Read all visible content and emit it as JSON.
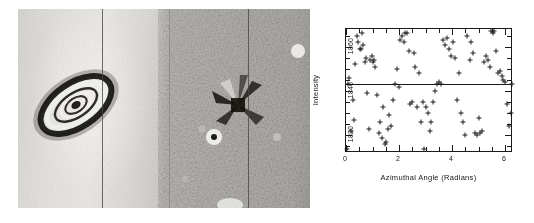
{
  "figure": {
    "panels": [
      {
        "name": "galaxy-image",
        "caption": ""
      },
      {
        "name": "residual-image",
        "caption": ""
      }
    ]
  },
  "chart_data": {
    "type": "scatter",
    "title": "",
    "xlabel": "Azimuthal Angle (Radians)",
    "ylabel": "Intensity",
    "xlim": [
      0,
      6.3
    ],
    "ylim": [
      1812,
      1868
    ],
    "xticks": [
      0,
      2,
      4,
      6
    ],
    "xticklabels": [
      "0",
      "2",
      "4",
      "6"
    ],
    "yticks": [
      1820,
      1840,
      1860
    ],
    "yticklabels": [
      "1820",
      "1840",
      "1860"
    ],
    "grid": false,
    "legend": null,
    "marker": "plus",
    "marker_color": "#1c1c1c",
    "fit_line": {
      "type": "horizontal",
      "y": 1843.0,
      "color": "#1a1a1a"
    },
    "x": [
      0.05,
      0.08,
      0.13,
      0.2,
      0.26,
      0.3,
      0.34,
      0.41,
      0.46,
      0.52,
      0.57,
      0.62,
      0.66,
      0.7,
      0.75,
      0.8,
      0.86,
      0.92,
      0.97,
      1.02,
      1.06,
      1.11,
      1.17,
      1.23,
      1.29,
      1.35,
      1.41,
      1.47,
      1.52,
      1.58,
      1.64,
      1.71,
      1.78,
      1.85,
      1.92,
      1.99,
      2.05,
      2.11,
      2.18,
      2.24,
      2.3,
      2.36,
      2.42,
      2.48,
      2.55,
      2.62,
      2.69,
      2.76,
      2.83,
      2.9,
      2.96,
      3.02,
      3.08,
      3.15,
      3.22,
      3.29,
      3.36,
      3.43,
      3.5,
      3.58,
      3.66,
      3.74,
      3.82,
      3.9,
      3.97,
      4.04,
      4.11,
      4.18,
      4.26,
      4.34,
      4.42,
      4.5,
      4.58,
      4.66,
      4.73,
      4.8,
      4.87,
      4.94,
      5.0,
      5.07,
      5.14,
      5.21,
      5.28,
      5.35,
      5.42,
      5.48,
      5.54,
      5.6,
      5.66,
      5.73,
      5.8,
      5.87,
      5.94,
      6.01,
      6.08,
      6.15,
      6.22,
      6.26
    ],
    "y": [
      1814,
      1843,
      1846,
      1822,
      1836,
      1827,
      1852,
      1865,
      1862,
      1859,
      1859,
      1866,
      1861,
      1853,
      1855,
      1839,
      1823,
      1854,
      1856,
      1853,
      1854,
      1851,
      1838,
      1821,
      1826,
      1819,
      1833,
      1816,
      1817,
      1823,
      1829,
      1824,
      1836,
      1843,
      1850,
      1842,
      1863,
      1865,
      1862,
      1866,
      1866,
      1858,
      1834,
      1835,
      1857,
      1851,
      1833,
      1848,
      1826,
      1835,
      1814,
      1833,
      1830,
      1822,
      1826,
      1835,
      1840,
      1843,
      1844,
      1843,
      1863,
      1861,
      1864,
      1859,
      1856,
      1862,
      1855,
      1836,
      1848,
      1830,
      1826,
      1820,
      1865,
      1854,
      1862,
      1857,
      1821,
      1820,
      1828,
      1821,
      1822,
      1853,
      1856,
      1854,
      1851,
      1867,
      1866,
      1867,
      1858,
      1848,
      1849,
      1847,
      1845,
      1844,
      1834,
      1824,
      1830,
      1843
    ]
  }
}
